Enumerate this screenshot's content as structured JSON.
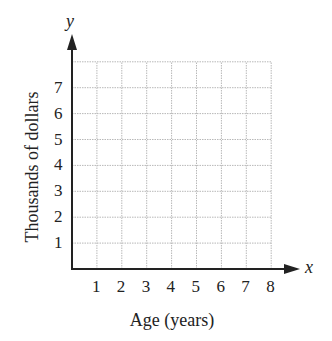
{
  "chart_data": {
    "type": "scatter",
    "title": "",
    "xlabel": "Age (years)",
    "ylabel": "Thousands of dollars",
    "x_axis_name": "x",
    "y_axis_name": "y",
    "xlim": [
      0,
      8
    ],
    "ylim": [
      0,
      8
    ],
    "x_ticks": [
      "1",
      "2",
      "3",
      "4",
      "5",
      "6",
      "7",
      "8"
    ],
    "y_ticks": [
      "1",
      "2",
      "3",
      "4",
      "5",
      "6",
      "7"
    ],
    "grid": true,
    "grid_style": "dotted",
    "series": []
  },
  "colors": {
    "axis": "#222222",
    "grid": "#b8b8b8",
    "background": "#ffffff"
  }
}
